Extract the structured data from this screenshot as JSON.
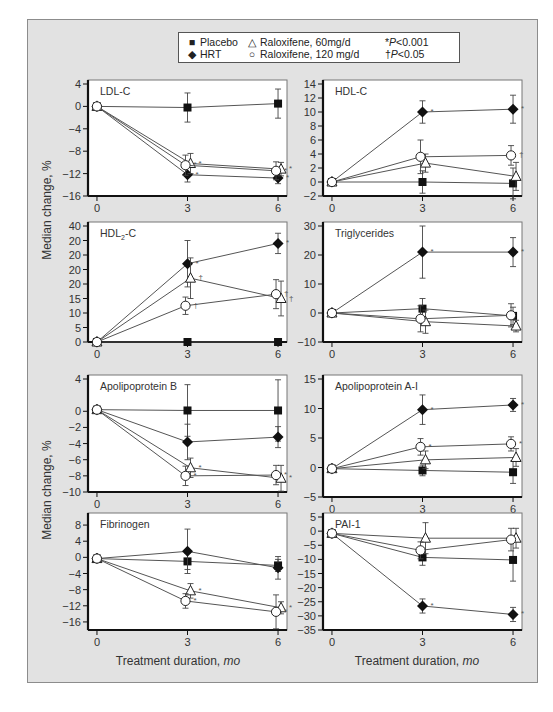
{
  "legend": {
    "items": [
      {
        "symbol": "■",
        "label": "Placebo"
      },
      {
        "symbol": "◆",
        "label": "HRT"
      },
      {
        "symbol": "△",
        "label": "Raloxifene, 60mg/d"
      },
      {
        "symbol": "○",
        "label": "Raloxifene, 120 mg/d"
      }
    ],
    "notes": [
      {
        "mark": "*",
        "p": "P",
        "text": "<0.001"
      },
      {
        "mark": "†",
        "p": "P",
        "text": "<0.05"
      }
    ]
  },
  "axes": {
    "ylabel": "Median change, %",
    "xlabel_prefix": "Treatment duration, ",
    "xlabel_unit": "mo",
    "x_ticks": [
      "0",
      "3",
      "6"
    ]
  },
  "colors": {
    "frame": "#e2e2e2",
    "plot_bg": "#ffffff",
    "line": "#555555",
    "marker": "#111111",
    "axis": "#111111"
  },
  "chart_data": [
    {
      "type": "line",
      "title": "LDL-C",
      "xlabel": "",
      "ylabel": "Median change, %",
      "x": [
        0,
        3,
        6
      ],
      "ylim": [
        -16,
        4
      ],
      "y_ticks": [
        "4",
        "0",
        "-4",
        "-8",
        "-12",
        "-16"
      ],
      "y_tick_values": [
        4,
        0,
        -4,
        -8,
        -12,
        -16
      ],
      "series": [
        {
          "name": "Placebo",
          "values": [
            0,
            -0.2,
            0.5
          ],
          "err": [
            0,
            2.6,
            2.6
          ],
          "sig": [
            "",
            "",
            ""
          ]
        },
        {
          "name": "HRT",
          "values": [
            0,
            -12.2,
            -12.8
          ],
          "err": [
            0,
            1.3,
            1.0
          ],
          "sig": [
            "",
            "*",
            "*"
          ]
        },
        {
          "name": "Raloxifene, 60mg/d",
          "values": [
            0,
            -10.2,
            -11.2
          ],
          "err": [
            0,
            1.8,
            1.2
          ],
          "sig": [
            "",
            "*",
            "*"
          ]
        },
        {
          "name": "Raloxifene, 120 mg/d",
          "values": [
            0,
            -10.5,
            -11.5
          ],
          "err": [
            0,
            1.8,
            1.6
          ],
          "sig": [
            "",
            "*",
            "*"
          ]
        }
      ]
    },
    {
      "type": "line",
      "title": "HDL-C",
      "xlabel": "",
      "ylabel": "",
      "x": [
        0,
        3,
        6
      ],
      "ylim": [
        -2,
        14
      ],
      "y_ticks": [
        "14",
        "12",
        "10",
        "8",
        "6",
        "4",
        "2",
        "0",
        "-2"
      ],
      "y_tick_values": [
        14,
        12,
        10,
        8,
        6,
        4,
        2,
        0,
        -2
      ],
      "series": [
        {
          "name": "Placebo",
          "values": [
            0,
            0,
            -0.2
          ],
          "err": [
            0,
            1.6,
            2.2
          ],
          "sig": [
            "",
            "",
            ""
          ]
        },
        {
          "name": "HRT",
          "values": [
            0,
            10.0,
            10.4
          ],
          "err": [
            0,
            1.6,
            2.0
          ],
          "sig": [
            "",
            "*",
            "*"
          ]
        },
        {
          "name": "Raloxifene, 60mg/d",
          "values": [
            0,
            2.7,
            0.8
          ],
          "err": [
            0,
            1.3,
            2.0
          ],
          "sig": [
            "",
            "",
            ""
          ]
        },
        {
          "name": "Raloxifene, 120 mg/d",
          "values": [
            0,
            3.6,
            3.8
          ],
          "err": [
            0,
            2.4,
            1.4
          ],
          "sig": [
            "",
            "",
            "†"
          ]
        }
      ]
    },
    {
      "type": "line",
      "title": "HDL2-C",
      "title_main": "HDL",
      "title_sub": "2",
      "title_tail": "-C",
      "xlabel": "",
      "ylabel": "Median change, %",
      "x": [
        0,
        3,
        6
      ],
      "ylim": [
        0,
        40
      ],
      "y_ticks": [
        "40",
        "20",
        "20",
        "20",
        "20",
        "15",
        "10",
        "5",
        "0"
      ],
      "y_tick_values": [
        40,
        35,
        30,
        25,
        20,
        15,
        10,
        5,
        0
      ],
      "series": [
        {
          "name": "Placebo",
          "values": [
            0,
            0,
            0
          ],
          "err": [
            0,
            0,
            0
          ],
          "sig": [
            "",
            "",
            ""
          ]
        },
        {
          "name": "HRT",
          "values": [
            0,
            27,
            34
          ],
          "err": [
            0,
            8,
            3.5
          ],
          "sig": [
            "",
            "*",
            "*"
          ]
        },
        {
          "name": "Raloxifene, 60mg/d",
          "values": [
            0,
            22,
            15
          ],
          "err": [
            0,
            7,
            6
          ],
          "sig": [
            "",
            "†",
            "†"
          ]
        },
        {
          "name": "Raloxifene, 120 mg/d",
          "values": [
            0,
            12.5,
            16.5
          ],
          "err": [
            0,
            3,
            5
          ],
          "sig": [
            "",
            "†",
            "†"
          ]
        }
      ]
    },
    {
      "type": "line",
      "title": "Triglycerides",
      "xlabel": "",
      "ylabel": "",
      "x": [
        0,
        3,
        6
      ],
      "ylim": [
        -10,
        30
      ],
      "y_ticks": [
        "30",
        "20",
        "10",
        "0",
        "-10"
      ],
      "y_tick_values": [
        30,
        20,
        10,
        0,
        -10
      ],
      "series": [
        {
          "name": "Placebo",
          "values": [
            0,
            1.5,
            -1
          ],
          "err": [
            0,
            3.5,
            3
          ],
          "sig": [
            "",
            "",
            ""
          ]
        },
        {
          "name": "HRT",
          "values": [
            0,
            21,
            21
          ],
          "err": [
            0,
            9,
            5
          ],
          "sig": [
            "",
            "*",
            "*"
          ]
        },
        {
          "name": "Raloxifene, 60mg/d",
          "values": [
            0,
            -3,
            -4.5
          ],
          "err": [
            0,
            4,
            2
          ],
          "sig": [
            "",
            "",
            ""
          ]
        },
        {
          "name": "Raloxifene, 120 mg/d",
          "values": [
            0,
            -2,
            -0.8
          ],
          "err": [
            0,
            4.5,
            4
          ],
          "sig": [
            "",
            "",
            ""
          ]
        }
      ]
    },
    {
      "type": "line",
      "title": "Apolipoprotein B",
      "xlabel": "Treatment duration, mo",
      "ylabel": "Median change, %",
      "x": [
        0,
        3,
        6
      ],
      "ylim": [
        -10,
        4
      ],
      "y_ticks": [
        "4",
        "0",
        "-2",
        "-4",
        "-6",
        "-8",
        "-10"
      ],
      "y_tick_values": [
        4,
        0,
        -2,
        -4,
        -6,
        -8,
        -10
      ],
      "series": [
        {
          "name": "Placebo",
          "values": [
            0.2,
            0.1,
            0.1
          ],
          "err": [
            0,
            3.2,
            3.8
          ],
          "sig": [
            "",
            "",
            ""
          ]
        },
        {
          "name": "HRT",
          "values": [
            0.2,
            -3.8,
            -3.2
          ],
          "err": [
            0,
            2.2,
            1.3
          ],
          "sig": [
            "",
            "",
            ""
          ]
        },
        {
          "name": "Raloxifene, 60mg/d",
          "values": [
            0.2,
            -7,
            -8.3
          ],
          "err": [
            0,
            1.2,
            1.6
          ],
          "sig": [
            "",
            "*",
            "*"
          ]
        },
        {
          "name": "Raloxifene, 120 mg/d",
          "values": [
            0.2,
            -8,
            -7.9
          ],
          "err": [
            0,
            1.2,
            1.2
          ],
          "sig": [
            "",
            "*",
            "*"
          ]
        }
      ]
    },
    {
      "type": "line",
      "title": "Apolipoprotein A-I",
      "xlabel": "",
      "ylabel": "",
      "x": [
        0,
        3,
        6
      ],
      "ylim": [
        -5,
        15
      ],
      "y_ticks": [
        "15",
        "10",
        "5",
        "0",
        "-5"
      ],
      "y_tick_values": [
        15,
        10,
        5,
        0,
        -5
      ],
      "series": [
        {
          "name": "Placebo",
          "values": [
            -0.2,
            -0.5,
            -0.8
          ],
          "err": [
            0,
            0.9,
            1.9
          ],
          "sig": [
            "",
            "",
            ""
          ]
        },
        {
          "name": "HRT",
          "values": [
            -0.2,
            9.8,
            10.6
          ],
          "err": [
            0,
            2.5,
            1.1
          ],
          "sig": [
            "",
            "*",
            "*"
          ]
        },
        {
          "name": "Raloxifene, 60mg/d",
          "values": [
            -0.2,
            1.3,
            1.7
          ],
          "err": [
            0,
            1.5,
            1.5
          ],
          "sig": [
            "",
            "",
            ""
          ]
        },
        {
          "name": "Raloxifene, 120 mg/d",
          "values": [
            -0.2,
            3.5,
            4.0
          ],
          "err": [
            0,
            1.4,
            1.2
          ],
          "sig": [
            "",
            "*",
            "*"
          ]
        }
      ]
    },
    {
      "type": "line",
      "title": "Fibrinogen",
      "xlabel": "Treatment duration, mo",
      "ylabel": "Median change, %",
      "x": [
        0,
        3,
        6
      ],
      "ylim": [
        -18,
        10
      ],
      "y_ticks": [
        "8",
        "4",
        "0",
        "-4",
        "-8",
        "-12",
        "-16"
      ],
      "y_tick_values": [
        8,
        4,
        0,
        -4,
        -8,
        -12,
        -16
      ],
      "series": [
        {
          "name": "Placebo",
          "values": [
            -0.3,
            -1,
            -2
          ],
          "err": [
            0,
            2,
            1.5
          ],
          "sig": [
            "",
            "",
            ""
          ]
        },
        {
          "name": "HRT",
          "values": [
            -0.3,
            1.5,
            -2.6
          ],
          "err": [
            0,
            5.5,
            2.8
          ],
          "sig": [
            "",
            "",
            ""
          ]
        },
        {
          "name": "Raloxifene, 60mg/d",
          "values": [
            -0.3,
            -8.3,
            -12.5
          ],
          "err": [
            0,
            1.8,
            1.5
          ],
          "sig": [
            "",
            "*",
            "*"
          ]
        },
        {
          "name": "Raloxifene, 120 mg/d",
          "values": [
            -0.3,
            -10.8,
            -13.5
          ],
          "err": [
            0,
            1.8,
            4.2
          ],
          "sig": [
            "",
            "*",
            "*"
          ]
        }
      ]
    },
    {
      "type": "line",
      "title": "PAI-1",
      "xlabel": "Treatment duration, mo",
      "ylabel": "",
      "x": [
        0,
        3,
        6
      ],
      "ylim": [
        -35,
        5
      ],
      "y_ticks": [
        "5",
        "0",
        "-5",
        "-10",
        "-15",
        "-20",
        "-25",
        "-30",
        "-35"
      ],
      "y_tick_values": [
        5,
        0,
        -5,
        -10,
        -15,
        -20,
        -25,
        -30,
        -35
      ],
      "series": [
        {
          "name": "Placebo",
          "values": [
            -0.8,
            -9.3,
            -10.2
          ],
          "err": [
            0,
            2.8,
            7.5
          ],
          "sig": [
            "",
            "",
            ""
          ]
        },
        {
          "name": "HRT",
          "values": [
            -0.8,
            -26.5,
            -29.5
          ],
          "err": [
            0,
            2.5,
            2.5
          ],
          "sig": [
            "",
            "*",
            "*"
          ]
        },
        {
          "name": "Raloxifene, 60mg/d",
          "values": [
            -0.8,
            -2.5,
            -2.5
          ],
          "err": [
            0,
            5.5,
            3.5
          ],
          "sig": [
            "",
            "",
            ""
          ]
        },
        {
          "name": "Raloxifene, 120 mg/d",
          "values": [
            -0.8,
            -6.8,
            -3
          ],
          "err": [
            0,
            3,
            4
          ],
          "sig": [
            "",
            "",
            ""
          ]
        }
      ]
    }
  ]
}
